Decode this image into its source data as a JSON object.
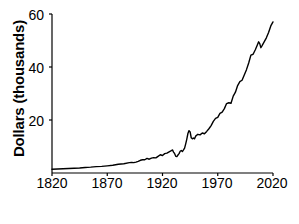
{
  "chart_data": {
    "type": "line",
    "title": "",
    "xlabel": "Year",
    "ylabel": "Dollars (thousands)",
    "xlim": [
      1820,
      2020
    ],
    "ylim": [
      0,
      60
    ],
    "xticks": [
      "1820",
      "1870",
      "1920",
      "1970",
      "2020"
    ],
    "yticks": [
      "20",
      "40",
      "60"
    ],
    "grid": false,
    "legend": "none",
    "line_color": "#000000",
    "series": [
      {
        "name": "Dollars (thousands)",
        "x": [
          1820,
          1825,
          1830,
          1835,
          1840,
          1845,
          1850,
          1855,
          1860,
          1865,
          1870,
          1875,
          1880,
          1885,
          1890,
          1892,
          1894,
          1896,
          1898,
          1900,
          1902,
          1904,
          1906,
          1908,
          1910,
          1912,
          1914,
          1916,
          1918,
          1920,
          1922,
          1924,
          1926,
          1928,
          1929,
          1930,
          1931,
          1932,
          1933,
          1934,
          1935,
          1936,
          1937,
          1938,
          1939,
          1940,
          1941,
          1942,
          1943,
          1944,
          1945,
          1946,
          1947,
          1948,
          1949,
          1950,
          1952,
          1954,
          1956,
          1958,
          1960,
          1962,
          1964,
          1966,
          1968,
          1970,
          1972,
          1974,
          1976,
          1978,
          1980,
          1982,
          1984,
          1986,
          1988,
          1990,
          1992,
          1994,
          1996,
          1998,
          2000,
          2002,
          2004,
          2006,
          2007,
          2008,
          2009,
          2010,
          2012,
          2014,
          2016,
          2018,
          2020
        ],
        "values": [
          1.4,
          1.5,
          1.6,
          1.7,
          1.8,
          1.9,
          2.1,
          2.2,
          2.4,
          2.5,
          2.7,
          2.9,
          3.3,
          3.5,
          3.9,
          4.0,
          3.9,
          4.1,
          4.4,
          4.8,
          5.0,
          5.0,
          5.5,
          5.2,
          5.6,
          5.8,
          5.7,
          6.3,
          6.9,
          6.6,
          7.3,
          7.5,
          8.0,
          8.4,
          8.7,
          7.9,
          7.3,
          6.3,
          6.2,
          6.8,
          7.3,
          8.2,
          8.5,
          8.1,
          8.7,
          9.4,
          11.0,
          12.8,
          14.9,
          16.0,
          15.5,
          13.3,
          12.9,
          13.2,
          12.9,
          13.9,
          14.6,
          14.4,
          15.1,
          14.8,
          15.7,
          16.7,
          17.9,
          19.5,
          20.6,
          21.0,
          22.5,
          23.0,
          24.3,
          26.2,
          26.5,
          26.3,
          29.0,
          30.5,
          33.0,
          34.5,
          35.0,
          37.0,
          39.0,
          41.5,
          44.5,
          44.8,
          46.5,
          48.5,
          49.5,
          48.8,
          47.3,
          48.0,
          49.5,
          51.0,
          53.0,
          55.5,
          57.0
        ]
      }
    ]
  },
  "axes": {
    "y_ticks": [
      {
        "label": "60",
        "value": 60
      },
      {
        "label": "40",
        "value": 40
      },
      {
        "label": "20",
        "value": 20
      }
    ],
    "x_ticks": [
      {
        "label": "1820",
        "value": 1820
      },
      {
        "label": "1870",
        "value": 1870
      },
      {
        "label": "1920",
        "value": 1920
      },
      {
        "label": "1970",
        "value": 1970
      },
      {
        "label": "2020",
        "value": 2020
      }
    ]
  },
  "labels": {
    "y_axis_title": "Dollars (thousands)",
    "x_axis_title": "Year"
  }
}
